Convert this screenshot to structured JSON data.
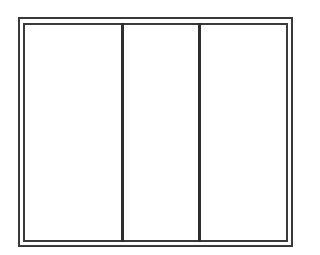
{
  "diagram": {
    "type": "elevation-drawing",
    "stroke_color": "#3a3a3a",
    "background_color": "#ffffff",
    "frame": {
      "outer": {
        "x": 18,
        "y": 17,
        "width": 275,
        "height": 230
      },
      "inner": {
        "x": 23,
        "y": 23,
        "width": 265,
        "height": 219
      }
    },
    "dividers": [
      {
        "x": 121,
        "width": 3
      },
      {
        "x": 198,
        "width": 3
      }
    ],
    "panels": [
      {
        "id": "left",
        "x": 25,
        "width": 96
      },
      {
        "id": "middle",
        "x": 124,
        "width": 74
      },
      {
        "id": "right",
        "x": 201,
        "width": 85
      }
    ]
  }
}
